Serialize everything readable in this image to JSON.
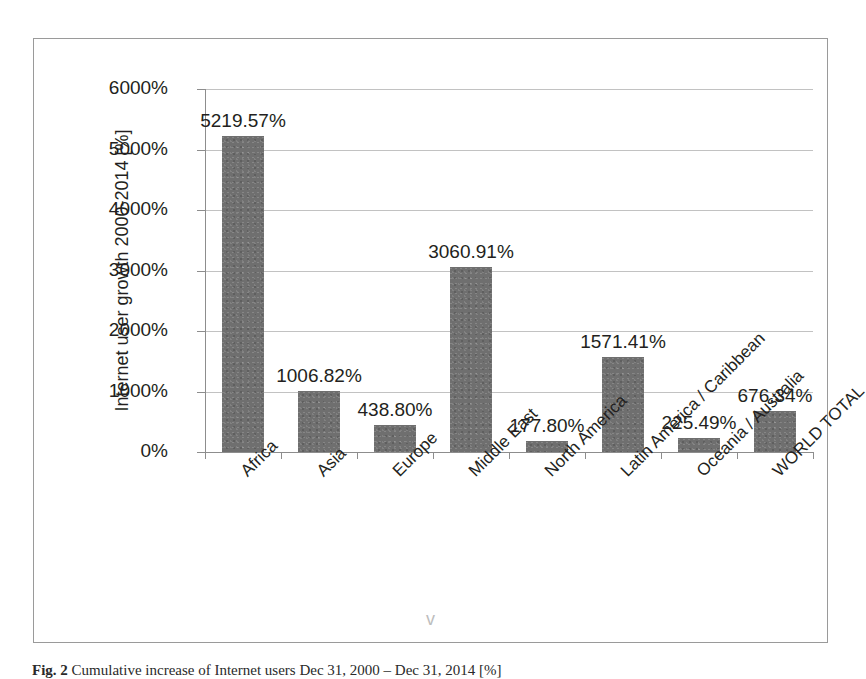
{
  "figure": {
    "caption_prefix": "Fig. 2",
    "caption_text": "Cumulative increase of Internet users Dec 31, 2000 – Dec 31, 2014 [%]",
    "scan_mark": "v",
    "frame_color": "#9a9a9a"
  },
  "chart_data": {
    "type": "bar",
    "title": "",
    "xlabel": "",
    "ylabel": "Internet user growth 2000-2014 [%]",
    "ylim": [
      0,
      6000
    ],
    "grid": true,
    "legend": "none",
    "bar_color": "#6f6f6f",
    "categories": [
      "Africa",
      "Asia",
      "Europe",
      "Middle East",
      "North America",
      "Latin America / Caribbean",
      "Oceania / Australia",
      "WORLD TOTAL"
    ],
    "values": [
      5219.57,
      1006.82,
      438.8,
      3060.91,
      177.8,
      1571.41,
      225.49,
      676.34
    ],
    "value_labels": [
      "5219.57%",
      "1006.82%",
      "438.80%",
      "3060.91%",
      "177.80%",
      "1571.41%",
      "225.49%",
      "676.34%"
    ],
    "ytick_values": [
      0,
      1000,
      2000,
      3000,
      4000,
      5000,
      6000
    ],
    "ytick_labels": [
      "0%",
      "1000%",
      "2000%",
      "3000%",
      "4000%",
      "5000%",
      "6000%"
    ]
  }
}
